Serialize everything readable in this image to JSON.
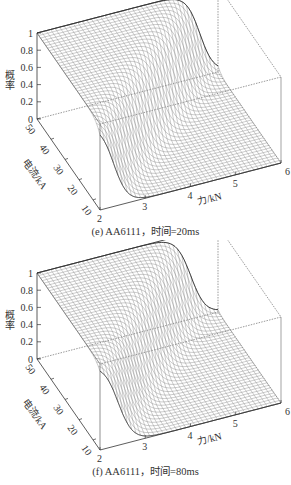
{
  "chart_data": [
    {
      "type": "surface3d",
      "panel": "e",
      "title": "(e) AA6111，时间=20ms",
      "material": "AA6111",
      "time_ms": 20,
      "xlabel": "力/kN",
      "ylabel": "电流/kA",
      "zlabel": "概率",
      "x_ticks": [
        "2",
        "3",
        "4",
        "5",
        "6"
      ],
      "y_ticks": [
        "10",
        "20",
        "30",
        "40",
        "50"
      ],
      "z_ticks": [
        "0",
        "0.2",
        "0.4",
        "0.6",
        "0.8",
        "1"
      ],
      "xlim": [
        2,
        6
      ],
      "ylim": [
        5,
        50
      ],
      "zlim": [
        0,
        1
      ],
      "grid": false,
      "description": "Sigmoidal probability surface: probability ~1 at low force / high current, dropping to ~0 at high force; transition force increases with current (≈2.3 kN at 5 kA to ≈5.6 kN at 50 kA).",
      "transition_force_kN": {
        "current_kA": [
          5,
          10,
          20,
          30,
          40,
          50
        ],
        "force_at_p05": [
          2.3,
          2.6,
          3.3,
          4.1,
          4.9,
          5.6
        ]
      },
      "steepness": 3.2
    },
    {
      "type": "surface3d",
      "panel": "f",
      "title": "(f) AA6111，时间=80ms",
      "material": "AA6111",
      "time_ms": 80,
      "xlabel": "力/kN",
      "ylabel": "电流/kA",
      "zlabel": "概率",
      "x_ticks": [
        "2",
        "3",
        "4",
        "5",
        "6"
      ],
      "y_ticks": [
        "10",
        "20",
        "30",
        "40",
        "50"
      ],
      "z_ticks": [
        "0",
        "0.2",
        "0.4",
        "0.6",
        "0.8",
        "1"
      ],
      "xlim": [
        2,
        6
      ],
      "ylim": [
        5,
        50
      ],
      "zlim": [
        0,
        1
      ],
      "grid": false,
      "description": "Similar sigmoidal surface; transition force increases with current (≈2.4 kN at 5 kA to ≈5.4 kN at 50 kA).",
      "transition_force_kN": {
        "current_kA": [
          5,
          10,
          20,
          30,
          40,
          50
        ],
        "force_at_p05": [
          2.4,
          2.7,
          3.3,
          4.0,
          4.7,
          5.4
        ]
      },
      "steepness": 3.0
    }
  ],
  "panels": [
    {
      "caption": "(e) AA6111，时间=20ms"
    },
    {
      "caption": "(f) AA6111，时间=80ms"
    }
  ]
}
